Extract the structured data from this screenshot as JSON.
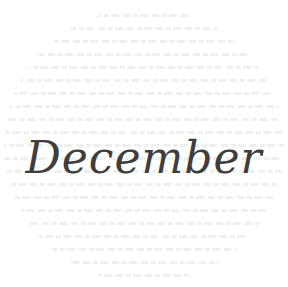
{
  "title": "December",
  "colors": {
    "background": "#ffffff",
    "text": "#3e3e3e",
    "texture": "#555555"
  }
}
